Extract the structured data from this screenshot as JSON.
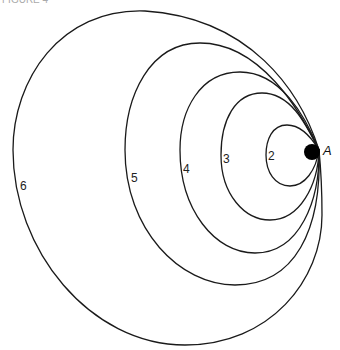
{
  "figure": {
    "title": "FIGURE 4",
    "point_label": "A",
    "curves": [
      {
        "label": "2"
      },
      {
        "label": "3"
      },
      {
        "label": "4"
      },
      {
        "label": "5"
      },
      {
        "label": "6"
      }
    ],
    "colors": {
      "stroke": "#1a1a1a",
      "dot": "#000000",
      "background": "#ffffff"
    }
  }
}
